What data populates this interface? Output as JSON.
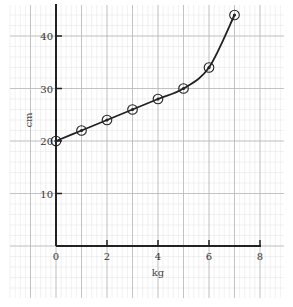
{
  "chart_data": {
    "type": "line",
    "title": "",
    "xlabel": "kg",
    "ylabel": "cm",
    "x": [
      0,
      1,
      2,
      3,
      4,
      5,
      6,
      7
    ],
    "series": [
      {
        "name": "length",
        "values": [
          20,
          22,
          24,
          26,
          28,
          30,
          34,
          44
        ],
        "marker": "circle-dot",
        "color": "#222222"
      }
    ],
    "xlim": [
      0,
      8
    ],
    "ylim": [
      0,
      45
    ],
    "xticks": [
      0,
      2,
      4,
      6,
      8
    ],
    "yticks": [
      10,
      20,
      30,
      40
    ],
    "xtick_labels": [
      "0",
      "2",
      "4",
      "6",
      "8"
    ],
    "ytick_labels": [
      "10",
      "20",
      "30",
      "40"
    ],
    "grid": true,
    "grid_style": "graph-paper",
    "legend": null
  },
  "colors": {
    "background": "#ffffff",
    "grid_major": "#b8b8b8",
    "grid_minor": "#e2e2e2",
    "axis": "#222222",
    "line": "#222222"
  }
}
